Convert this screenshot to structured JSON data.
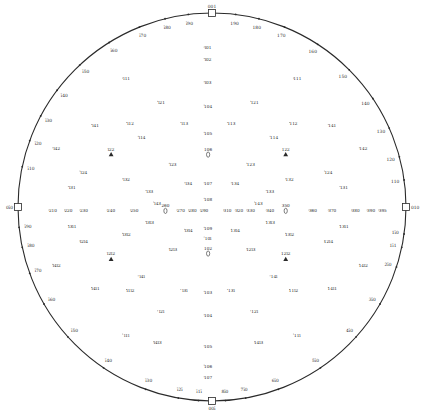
{
  "labels_approximate": "Pole labels are illegible at source resolution; strings below are Miller-index-style placeholders, not transcriptions.",
  "colors": {
    "ink": "#2a2a2a",
    "background": "#ffffff"
  },
  "cardinal_poles": [
    {
      "label": "001",
      "dir": "top"
    },
    {
      "label": "010",
      "dir": "right"
    },
    {
      "label": "00ī",
      "dir": "bottom"
    },
    {
      "label": "0ī0",
      "dir": "left"
    }
  ],
  "rim_poles": [
    {
      "label": "ī10",
      "ang": -168
    },
    {
      "label": "ī20",
      "ang": -160
    },
    {
      "label": "ī30",
      "ang": -152
    },
    {
      "label": "ī40",
      "ang": -143
    },
    {
      "label": "ī50",
      "ang": -133
    },
    {
      "label": "ī60",
      "ang": -122
    },
    {
      "label": "ī70",
      "ang": -112
    },
    {
      "label": "ī80",
      "ang": -104
    },
    {
      "label": "ī90",
      "ang": -97
    },
    {
      "label": "190",
      "ang": -83
    },
    {
      "label": "180",
      "ang": -76
    },
    {
      "label": "170",
      "ang": -68
    },
    {
      "label": "160",
      "ang": -57
    },
    {
      "label": "150",
      "ang": -45
    },
    {
      "label": "140",
      "ang": -34
    },
    {
      "label": "130",
      "ang": -24
    },
    {
      "label": "120",
      "ang": -15
    },
    {
      "label": "110",
      "ang": -8
    },
    {
      "label": "1ī0",
      "ang": 8
    },
    {
      "label": "1ī1",
      "ang": 12
    },
    {
      "label": "2ī0",
      "ang": 18
    },
    {
      "label": "3ī0",
      "ang": 30
    },
    {
      "label": "4ī0",
      "ang": 42
    },
    {
      "label": "5ī0",
      "ang": 56
    },
    {
      "label": "6ī0",
      "ang": 70
    },
    {
      "label": "7ī0",
      "ang": 80
    },
    {
      "label": "8ī0",
      "ang": 86
    },
    {
      "label": "ī1ī",
      "ang": 94
    },
    {
      "label": "ī2ī",
      "ang": 100
    },
    {
      "label": "ī30",
      "ang": 110
    },
    {
      "label": "ī40",
      "ang": 124
    },
    {
      "label": "ī50",
      "ang": 138
    },
    {
      "label": "ī60",
      "ang": 150
    },
    {
      "label": "ī70",
      "ang": 160
    },
    {
      "label": "ī80",
      "ang": 168
    },
    {
      "label": "ī90",
      "ang": 174
    }
  ],
  "inner_poles": [
    {
      "label": "ī01",
      "x": -0.02,
      "y": -0.82
    },
    {
      "label": "ī02",
      "x": -0.02,
      "y": -0.76
    },
    {
      "label": "ī03",
      "x": -0.02,
      "y": -0.64
    },
    {
      "label": "104",
      "x": -0.02,
      "y": -0.52
    },
    {
      "label": "105",
      "x": -0.02,
      "y": -0.38
    },
    {
      "label": "106",
      "x": -0.02,
      "y": -0.27,
      "marker": "oval"
    },
    {
      "label": "107",
      "x": -0.02,
      "y": -0.12
    },
    {
      "label": "108",
      "x": -0.02,
      "y": -0.04
    },
    {
      "label": "109",
      "x": -0.02,
      "y": 0.11
    },
    {
      "label": "10ī",
      "x": -0.02,
      "y": 0.16
    },
    {
      "label": "102",
      "x": -0.02,
      "y": 0.24,
      "marker": "oval"
    },
    {
      "label": "103",
      "x": -0.02,
      "y": 0.44
    },
    {
      "label": "104",
      "x": -0.02,
      "y": 0.56
    },
    {
      "label": "105",
      "x": -0.02,
      "y": 0.72
    },
    {
      "label": "106",
      "x": -0.02,
      "y": 0.82
    },
    {
      "label": "107",
      "x": -0.02,
      "y": 0.88
    },
    {
      "label": "ī11",
      "x": -0.44,
      "y": -0.66
    },
    {
      "label": "111",
      "x": 0.44,
      "y": -0.66
    },
    {
      "label": "ī21",
      "x": -0.26,
      "y": -0.54
    },
    {
      "label": "121",
      "x": 0.22,
      "y": -0.54
    },
    {
      "label": "ī12",
      "x": -0.42,
      "y": -0.43
    },
    {
      "label": "112",
      "x": 0.42,
      "y": -0.43
    },
    {
      "label": "ī13",
      "x": -0.14,
      "y": -0.43
    },
    {
      "label": "113",
      "x": 0.1,
      "y": -0.43
    },
    {
      "label": "ī14",
      "x": -0.36,
      "y": -0.36
    },
    {
      "label": "114",
      "x": 0.32,
      "y": -0.36
    },
    {
      "label": "ī22",
      "x": -0.52,
      "y": -0.27,
      "marker": "triangle"
    },
    {
      "label": "122",
      "x": 0.38,
      "y": -0.27,
      "marker": "triangle"
    },
    {
      "label": "ī23",
      "x": -0.2,
      "y": -0.22
    },
    {
      "label": "123",
      "x": 0.2,
      "y": -0.22
    },
    {
      "label": "ī24",
      "x": -0.66,
      "y": -0.18
    },
    {
      "label": "124",
      "x": 0.6,
      "y": -0.18
    },
    {
      "label": "ī31",
      "x": -0.72,
      "y": -0.1
    },
    {
      "label": "131",
      "x": 0.68,
      "y": -0.1
    },
    {
      "label": "ī32",
      "x": -0.44,
      "y": -0.14
    },
    {
      "label": "132",
      "x": 0.4,
      "y": -0.14
    },
    {
      "label": "ī33",
      "x": -0.32,
      "y": -0.08
    },
    {
      "label": "133",
      "x": 0.3,
      "y": -0.08
    },
    {
      "label": "ī34",
      "x": -0.12,
      "y": -0.12
    },
    {
      "label": "134",
      "x": 0.12,
      "y": -0.12
    },
    {
      "label": "ī41",
      "x": -0.6,
      "y": -0.42
    },
    {
      "label": "141",
      "x": 0.62,
      "y": -0.42
    },
    {
      "label": "ī42",
      "x": -0.8,
      "y": -0.3
    },
    {
      "label": "142",
      "x": 0.78,
      "y": -0.3
    },
    {
      "label": "ī43",
      "x": -0.28,
      "y": -0.02
    },
    {
      "label": "143",
      "x": 0.24,
      "y": -0.02
    },
    {
      "label": "210",
      "x": -0.82,
      "y": 0.02
    },
    {
      "label": "220",
      "x": -0.74,
      "y": 0.02
    },
    {
      "label": "230",
      "x": -0.66,
      "y": 0.02
    },
    {
      "label": "240",
      "x": -0.52,
      "y": 0.02
    },
    {
      "label": "250",
      "x": -0.4,
      "y": 0.02
    },
    {
      "label": "260",
      "x": -0.24,
      "y": 0.02,
      "marker": "oval"
    },
    {
      "label": "270",
      "x": -0.16,
      "y": 0.02
    },
    {
      "label": "280",
      "x": -0.1,
      "y": 0.02
    },
    {
      "label": "290",
      "x": -0.04,
      "y": 0.02
    },
    {
      "label": "310",
      "x": 0.08,
      "y": 0.02
    },
    {
      "label": "320",
      "x": 0.14,
      "y": 0.02
    },
    {
      "label": "330",
      "x": 0.2,
      "y": 0.02
    },
    {
      "label": "340",
      "x": 0.3,
      "y": 0.02
    },
    {
      "label": "350",
      "x": 0.38,
      "y": 0.02,
      "marker": "oval"
    },
    {
      "label": "360",
      "x": 0.52,
      "y": 0.02
    },
    {
      "label": "370",
      "x": 0.62,
      "y": 0.02
    },
    {
      "label": "380",
      "x": 0.74,
      "y": 0.02
    },
    {
      "label": "390",
      "x": 0.82,
      "y": 0.02
    },
    {
      "label": "395",
      "x": 0.88,
      "y": 0.02
    },
    {
      "label": "ī1ī",
      "x": -0.44,
      "y": 0.66
    },
    {
      "label": "11ī",
      "x": 0.44,
      "y": 0.66
    },
    {
      "label": "ī2ī",
      "x": -0.26,
      "y": 0.54
    },
    {
      "label": "12ī",
      "x": 0.22,
      "y": 0.54
    },
    {
      "label": "ī1ī2",
      "x": -0.42,
      "y": 0.43
    },
    {
      "label": "11ī2",
      "x": 0.42,
      "y": 0.43
    },
    {
      "label": "ī3ī",
      "x": -0.14,
      "y": 0.43
    },
    {
      "label": "13ī",
      "x": 0.1,
      "y": 0.43
    },
    {
      "label": "ī4ī",
      "x": -0.36,
      "y": 0.36
    },
    {
      "label": "14ī",
      "x": 0.32,
      "y": 0.36
    },
    {
      "label": "ī2ī2",
      "x": -0.52,
      "y": 0.27,
      "marker": "triangle"
    },
    {
      "label": "12ī2",
      "x": 0.38,
      "y": 0.27,
      "marker": "triangle"
    },
    {
      "label": "ī2ī3",
      "x": -0.2,
      "y": 0.22
    },
    {
      "label": "12ī3",
      "x": 0.2,
      "y": 0.22
    },
    {
      "label": "ī2ī4",
      "x": -0.66,
      "y": 0.18
    },
    {
      "label": "12ī4",
      "x": 0.6,
      "y": 0.18
    },
    {
      "label": "ī3ī1",
      "x": -0.72,
      "y": 0.1
    },
    {
      "label": "13ī1",
      "x": 0.68,
      "y": 0.1
    },
    {
      "label": "ī3ī2",
      "x": -0.44,
      "y": 0.14
    },
    {
      "label": "13ī2",
      "x": 0.4,
      "y": 0.14
    },
    {
      "label": "ī3ī3",
      "x": -0.32,
      "y": 0.08
    },
    {
      "label": "13ī3",
      "x": 0.3,
      "y": 0.08
    },
    {
      "label": "ī3ī4",
      "x": -0.12,
      "y": 0.12
    },
    {
      "label": "13ī4",
      "x": 0.12,
      "y": 0.12
    },
    {
      "label": "ī4ī1",
      "x": -0.6,
      "y": 0.42
    },
    {
      "label": "14ī1",
      "x": 0.62,
      "y": 0.42
    },
    {
      "label": "ī4ī2",
      "x": -0.8,
      "y": 0.3
    },
    {
      "label": "14ī2",
      "x": 0.78,
      "y": 0.3
    },
    {
      "label": "ī4ī3",
      "x": -0.28,
      "y": 0.7
    },
    {
      "label": "14ī3",
      "x": 0.24,
      "y": 0.7
    }
  ]
}
